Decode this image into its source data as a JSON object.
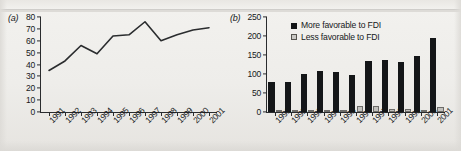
{
  "figure": {
    "panel_a_label": "(a)",
    "panel_b_label": "(b)"
  },
  "chart_data": [
    {
      "type": "line",
      "panel": "(a)",
      "title": "",
      "xlabel": "",
      "ylabel": "",
      "grid": false,
      "legend": "none",
      "categories": [
        "1991",
        "1992",
        "1993",
        "1994",
        "1995",
        "1996",
        "1997",
        "1998",
        "1999",
        "2000",
        "2001"
      ],
      "x": [
        "1991",
        "1992",
        "1993",
        "1994",
        "1995",
        "1996",
        "1997",
        "1998",
        "1999",
        "2000",
        "2001"
      ],
      "values": [
        35,
        43,
        56,
        49,
        64,
        65,
        76,
        60,
        65,
        69,
        71
      ],
      "ylim": [
        0,
        80
      ],
      "yticks": [
        0,
        10,
        20,
        30,
        40,
        50,
        60,
        70,
        80
      ],
      "ytick_labels": [
        "0",
        "10",
        "20",
        "30",
        "40",
        "50",
        "60",
        "70",
        "80"
      ],
      "line_color": "#2a2c2e"
    },
    {
      "type": "bar",
      "panel": "(b)",
      "title": "",
      "xlabel": "",
      "ylabel": "",
      "grid": false,
      "legend": "top-left",
      "categories": [
        "1991",
        "1992",
        "1993",
        "1994",
        "1995",
        "1996",
        "1997",
        "1998",
        "1999",
        "2000",
        "2001"
      ],
      "series": [
        {
          "name": "More favorable to FDI",
          "color": "#141618",
          "values": [
            80,
            79,
            101,
            108,
            106,
            98,
            135,
            136,
            131,
            147,
            194
          ]
        },
        {
          "name": "Less favorable to FDI",
          "color": "#c2c1bd",
          "values": [
            2,
            2,
            2,
            2,
            6,
            16,
            16,
            9,
            9,
            3,
            12
          ]
        }
      ],
      "ylim": [
        0,
        250
      ],
      "yticks": [
        0,
        50,
        100,
        150,
        200,
        250
      ],
      "ytick_labels": [
        "0",
        "50",
        "100",
        "150",
        "200",
        "250"
      ]
    }
  ]
}
